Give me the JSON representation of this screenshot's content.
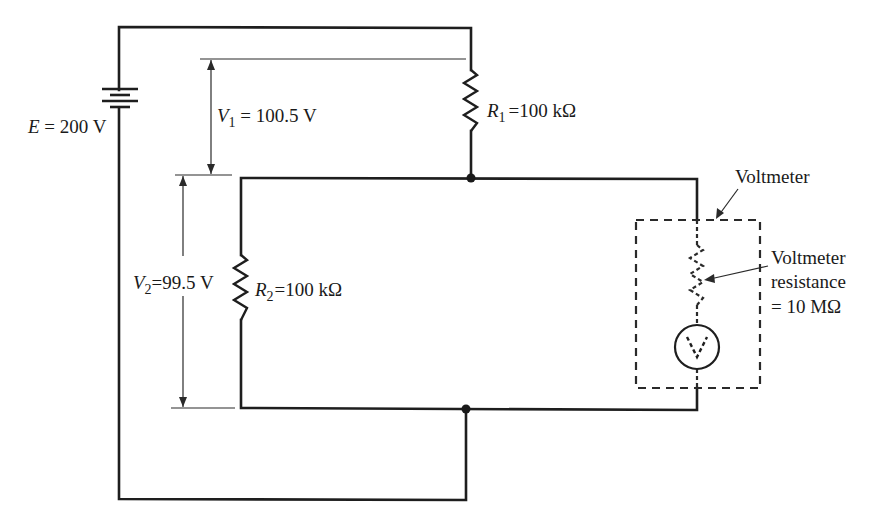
{
  "diagram": {
    "type": "circuit",
    "source": {
      "symbol": "E",
      "value": "200 V",
      "label": "E = 200 V"
    },
    "resistors": [
      {
        "symbol": "R",
        "subscript": "1",
        "equals": "=100 kΩ"
      },
      {
        "symbol": "R",
        "subscript": "2",
        "equals": "=100 kΩ"
      }
    ],
    "voltages": [
      {
        "symbol": "V",
        "subscript": "1",
        "equals": " = 100.5 V"
      },
      {
        "symbol": "V",
        "subscript": "2",
        "equals": "=99.5 V"
      }
    ],
    "voltmeter": {
      "label": "Voltmeter",
      "resistance_line1": "Voltmeter",
      "resistance_line2": "resistance",
      "resistance_line3": "= 10 MΩ",
      "meter_glyph": "V"
    },
    "colors": {
      "line": "#1e1e1e",
      "background": "#ffffff"
    }
  }
}
